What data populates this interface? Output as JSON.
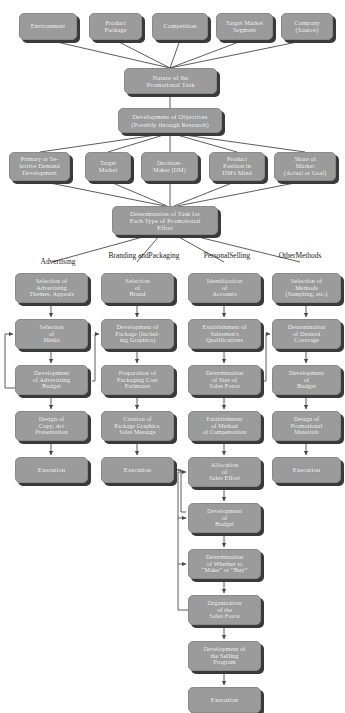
{
  "diagram": {
    "style": {
      "node_fill": "#9b9b9b",
      "node_text": "#ffffff",
      "shadow": "#3a3a3a",
      "line": "#4a4a4a",
      "background": "#ffffff"
    },
    "column_headers": [
      {
        "label": "Advertising",
        "x": 14,
        "y": 258,
        "w": 88
      },
      {
        "label": "Branding and\nPackaging",
        "x": 100,
        "y": 252,
        "w": 88
      },
      {
        "label": "Personal\nSelling",
        "x": 185,
        "y": 252,
        "w": 84
      },
      {
        "label": "Other\nMethods",
        "x": 262,
        "y": 252,
        "w": 76
      }
    ],
    "nodes": [
      {
        "id": "environment",
        "label": "Environment",
        "x": 19,
        "y": 13,
        "w": 58,
        "h": 27,
        "fs": 6.4
      },
      {
        "id": "product-package",
        "label": "Product\nPackage",
        "x": 89,
        "y": 13,
        "w": 53,
        "h": 27,
        "fs": 6.4
      },
      {
        "id": "competition",
        "label": "Competition",
        "x": 152,
        "y": 13,
        "w": 56,
        "h": 27,
        "fs": 6.4
      },
      {
        "id": "target-market-segment",
        "label": "Target Market\nSegment",
        "x": 216,
        "y": 13,
        "w": 57,
        "h": 27,
        "fs": 6.4
      },
      {
        "id": "company-source",
        "label": "Company\n(Source)",
        "x": 281,
        "y": 13,
        "w": 52,
        "h": 27,
        "fs": 6.4
      },
      {
        "id": "nature-of-task",
        "label": "Nature of the\nPromotional Task",
        "x": 124,
        "y": 68,
        "w": 93,
        "h": 26,
        "fs": 6.6
      },
      {
        "id": "development-of-objectives",
        "label": "Development of Objectives\n(Possibly through Research)",
        "x": 118,
        "y": 108,
        "w": 104,
        "h": 25,
        "fs": 6.6
      },
      {
        "id": "primary-selective-demand",
        "label": "Primary or Se-\nlective Demand\nDevelopment",
        "x": 9,
        "y": 152,
        "w": 61,
        "h": 29,
        "fs": 6.2
      },
      {
        "id": "target-market",
        "label": "Target\nMarket",
        "x": 85,
        "y": 152,
        "w": 46,
        "h": 29,
        "fs": 6.2
      },
      {
        "id": "decision-maker",
        "label": "Decision-\nMaker (DM)",
        "x": 141,
        "y": 152,
        "w": 57,
        "h": 29,
        "fs": 6.2
      },
      {
        "id": "product-position",
        "label": "Product\nPosition in\nDM's Mind",
        "x": 209,
        "y": 152,
        "w": 56,
        "h": 29,
        "fs": 6.2
      },
      {
        "id": "share-of-market",
        "label": "Share of\nMarket\n(Actual or Goal)",
        "x": 274,
        "y": 152,
        "w": 62,
        "h": 29,
        "fs": 6.2
      },
      {
        "id": "determination-of-task",
        "label": "Determination of Task for\nEach Type of Promotional\nEffort",
        "x": 112,
        "y": 206,
        "w": 106,
        "h": 29,
        "fs": 6.5
      },
      {
        "id": "adv-themes",
        "label": "Selection of\nAdvertising\nThemes, Appeals",
        "x": 15,
        "y": 273,
        "w": 73,
        "h": 30,
        "fs": 6.3
      },
      {
        "id": "adv-media",
        "label": "Selection\nof\nMedia",
        "x": 15,
        "y": 319,
        "w": 73,
        "h": 30,
        "fs": 6.3
      },
      {
        "id": "adv-budget",
        "label": "Development\nof Advertising\nBudget",
        "x": 15,
        "y": 365,
        "w": 73,
        "h": 30,
        "fs": 6.3
      },
      {
        "id": "adv-copy-art",
        "label": "Design of\nCopy, Art\nPresentation",
        "x": 15,
        "y": 411,
        "w": 73,
        "h": 30,
        "fs": 6.3
      },
      {
        "id": "adv-execution",
        "label": "Execution",
        "x": 15,
        "y": 457,
        "w": 73,
        "h": 26,
        "fs": 6.5
      },
      {
        "id": "brand-selection",
        "label": "Selection\nof\nBrand",
        "x": 101,
        "y": 273,
        "w": 73,
        "h": 30,
        "fs": 6.3
      },
      {
        "id": "package-development",
        "label": "Development of\nPackage (Includ-\ning Graphics)",
        "x": 101,
        "y": 319,
        "w": 73,
        "h": 30,
        "fs": 6.3
      },
      {
        "id": "packaging-cost",
        "label": "Preparation of\nPackaging Cost\nEstimates",
        "x": 101,
        "y": 365,
        "w": 73,
        "h": 30,
        "fs": 6.3
      },
      {
        "id": "package-graphics",
        "label": "Creation of\nPackage Graphics,\nSales Message",
        "x": 101,
        "y": 411,
        "w": 73,
        "h": 30,
        "fs": 6.0
      },
      {
        "id": "brand-execution",
        "label": "Execution",
        "x": 101,
        "y": 457,
        "w": 73,
        "h": 26,
        "fs": 6.5
      },
      {
        "id": "identification-accounts",
        "label": "Identification\nof\nAccounts",
        "x": 188,
        "y": 273,
        "w": 73,
        "h": 30,
        "fs": 6.3
      },
      {
        "id": "salesmen-qualifications",
        "label": "Establishment of\nSalesmen's\nQualifications",
        "x": 188,
        "y": 319,
        "w": 73,
        "h": 30,
        "fs": 6.3
      },
      {
        "id": "size-sales-force",
        "label": "Determination\nof Size of\nSales Force",
        "x": 188,
        "y": 365,
        "w": 73,
        "h": 30,
        "fs": 6.3
      },
      {
        "id": "method-compensation",
        "label": "Establishment\nof Method\nof Compensation",
        "x": 188,
        "y": 411,
        "w": 73,
        "h": 30,
        "fs": 6.1
      },
      {
        "id": "allocation-sales-effort",
        "label": "Allocation\nof\nSales Effort",
        "x": 188,
        "y": 457,
        "w": 73,
        "h": 30,
        "fs": 6.3
      },
      {
        "id": "sales-budget",
        "label": "Development\nof\nBudget",
        "x": 188,
        "y": 503,
        "w": 73,
        "h": 30,
        "fs": 6.3
      },
      {
        "id": "make-or-buy",
        "label": "Determination\nof Whether to\n“Make” or “Buy”",
        "x": 188,
        "y": 549,
        "w": 73,
        "h": 30,
        "fs": 6.3
      },
      {
        "id": "organization-sales-force",
        "label": "Organization\nof the\nSales Force",
        "x": 188,
        "y": 595,
        "w": 73,
        "h": 30,
        "fs": 6.3
      },
      {
        "id": "selling-program",
        "label": "Development of\nthe Selling\nProgram",
        "x": 188,
        "y": 641,
        "w": 73,
        "h": 30,
        "fs": 6.3
      },
      {
        "id": "selling-execution",
        "label": "Execution",
        "x": 188,
        "y": 687,
        "w": 73,
        "h": 26,
        "fs": 6.5
      },
      {
        "id": "other-methods-selection",
        "label": "Selection of\nMethods\n(Sampling, etc.)",
        "x": 272,
        "y": 273,
        "w": 69,
        "h": 30,
        "fs": 6.3
      },
      {
        "id": "desired-coverage",
        "label": "Determination\nof Desired\nCoverage",
        "x": 272,
        "y": 319,
        "w": 69,
        "h": 30,
        "fs": 6.3
      },
      {
        "id": "other-budget",
        "label": "Development\nof\nBudget",
        "x": 272,
        "y": 365,
        "w": 69,
        "h": 30,
        "fs": 6.3
      },
      {
        "id": "promotional-materials",
        "label": "Design of\nPromotional\nMaterials",
        "x": 272,
        "y": 411,
        "w": 69,
        "h": 30,
        "fs": 6.3
      },
      {
        "id": "other-execution",
        "label": "Execution",
        "x": 272,
        "y": 457,
        "w": 69,
        "h": 26,
        "fs": 6.5
      }
    ]
  }
}
